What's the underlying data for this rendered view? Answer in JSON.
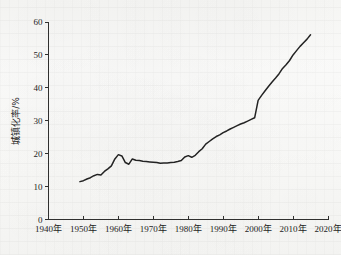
{
  "chart_data": {
    "type": "line",
    "title": "",
    "xlabel": "",
    "ylabel": "城镇化率/%",
    "xlim": [
      1940,
      2020
    ],
    "ylim": [
      0,
      60
    ],
    "grid": false,
    "legend": null,
    "xtick_labels": [
      "1940年",
      "1950年",
      "1960年",
      "1970年",
      "1980年",
      "1990年",
      "2000年",
      "2010年",
      "2020年"
    ],
    "xtick_values": [
      1940,
      1950,
      1960,
      1970,
      1980,
      1990,
      2000,
      2010,
      2020
    ],
    "ytick_labels": [
      "0",
      "10",
      "20",
      "30",
      "40",
      "50",
      "60"
    ],
    "ytick_values": [
      0,
      10,
      20,
      30,
      40,
      50,
      60
    ],
    "series": [
      {
        "name": "城镇化率",
        "color": "#232323",
        "x": [
          1949,
          1950,
          1951,
          1952,
          1953,
          1954,
          1955,
          1956,
          1957,
          1958,
          1959,
          1960,
          1961,
          1962,
          1963,
          1964,
          1965,
          1966,
          1967,
          1968,
          1969,
          1970,
          1971,
          1972,
          1973,
          1974,
          1975,
          1976,
          1977,
          1978,
          1979,
          1980,
          1981,
          1982,
          1983,
          1984,
          1985,
          1986,
          1987,
          1988,
          1989,
          1990,
          1991,
          1992,
          1993,
          1994,
          1995,
          1996,
          1997,
          1998,
          1999,
          2000,
          2001,
          2002,
          2003,
          2004,
          2005,
          2006,
          2007,
          2008,
          2009,
          2010,
          2011,
          2012,
          2013,
          2014,
          2015
        ],
        "y": [
          11.5,
          11.8,
          12.3,
          12.7,
          13.3,
          13.7,
          13.5,
          14.6,
          15.4,
          16.3,
          18.4,
          19.7,
          19.3,
          17.3,
          16.8,
          18.4,
          18.0,
          17.9,
          17.7,
          17.6,
          17.5,
          17.4,
          17.3,
          17.1,
          17.2,
          17.2,
          17.3,
          17.4,
          17.6,
          17.9,
          19.0,
          19.4,
          18.9,
          19.5,
          20.6,
          21.5,
          22.9,
          23.7,
          24.5,
          25.2,
          25.7,
          26.4,
          26.9,
          27.5,
          28.0,
          28.5,
          29.0,
          29.4,
          29.9,
          30.4,
          30.9,
          36.2,
          37.7,
          39.1,
          40.5,
          41.8,
          43.0,
          44.3,
          45.9,
          47.0,
          48.3,
          50.0,
          51.3,
          52.6,
          53.7,
          54.8,
          56.1
        ]
      }
    ]
  },
  "axis_titles": {
    "y": "城镇化率/%"
  }
}
